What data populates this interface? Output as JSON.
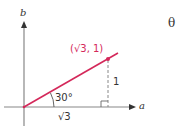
{
  "diagram": {
    "axes": {
      "x_label": "a",
      "y_label": "b"
    },
    "point": {
      "label": "(√3, 1)",
      "color": "#d4285a"
    },
    "angle_label": "30°",
    "opposite_side_label": "1",
    "adjacent_side_label": "√3",
    "corner_symbol": "θ",
    "colors": {
      "axis": "#777777",
      "ray": "#d4285a",
      "dashed": "#888888"
    }
  }
}
